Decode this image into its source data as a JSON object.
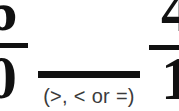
{
  "page": {
    "kind": "math-worksheet-fraction-comparison",
    "background_color": "#ffffff",
    "ink_color": "#111111",
    "hint_color": "#3b3b3b"
  },
  "problem": {
    "left_fraction": {
      "numerator": "6",
      "denominator": "0",
      "cropped": "left edge"
    },
    "comparison": {
      "answer_value": "",
      "hint": "(>, < or =)"
    },
    "right_fraction": {
      "numerator": "4",
      "denominator": "1",
      "cropped": "right edge"
    }
  }
}
